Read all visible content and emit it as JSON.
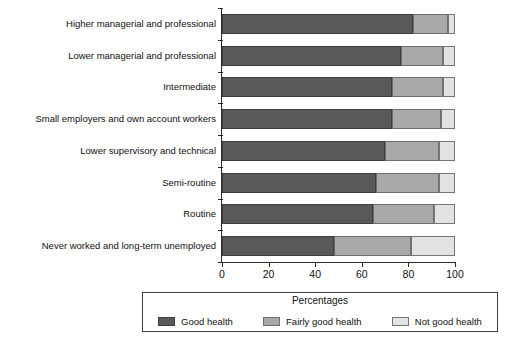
{
  "chart_data": {
    "type": "bar",
    "orientation": "horizontal",
    "stacked": true,
    "title": "",
    "xlabel": "",
    "ylabel": "",
    "xlim": [
      0,
      100
    ],
    "xticks": [
      0,
      20,
      40,
      60,
      80,
      100
    ],
    "xtick_labels": [
      "0",
      "20",
      "40",
      "60",
      "80",
      "100"
    ],
    "grid": false,
    "legend_position": "bottom",
    "legend_title": "Percentages",
    "categories": [
      "Higher managerial and professional",
      "Lower managerial and professional",
      "Intermediate",
      "Small employers and own account workers",
      "Lower supervisory and technical",
      "Semi-routine",
      "Routine",
      "Never worked and long-term unemployed"
    ],
    "series": [
      {
        "name": "Good health",
        "color": "#595959",
        "values": [
          82,
          77,
          73,
          73,
          70,
          66,
          65,
          48
        ]
      },
      {
        "name": "Fairly good health",
        "color": "#a8a8a8",
        "values": [
          15,
          18,
          22,
          21,
          23,
          27,
          26,
          33
        ]
      },
      {
        "name": "Not good health",
        "color": "#e2e2e2",
        "values": [
          3,
          5,
          5,
          6,
          7,
          7,
          9,
          19
        ]
      }
    ]
  }
}
